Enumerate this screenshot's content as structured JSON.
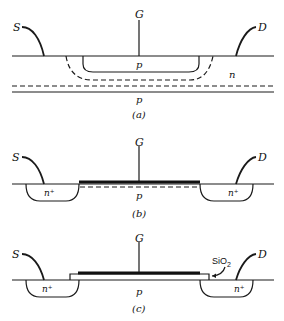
{
  "figure": {
    "panels": [
      {
        "id": "a",
        "caption": "(a)",
        "terminals": {
          "source": "S",
          "gate": "G",
          "drain": "D"
        },
        "regions": {
          "well": "p",
          "body": "n",
          "substrate": "p"
        }
      },
      {
        "id": "b",
        "caption": "(b)",
        "terminals": {
          "source": "S",
          "gate": "G",
          "drain": "D"
        },
        "regions": {
          "source_diffusion": "n⁺",
          "drain_diffusion": "n⁺",
          "substrate": "p"
        }
      },
      {
        "id": "c",
        "caption": "(c)",
        "terminals": {
          "source": "S",
          "gate": "G",
          "drain": "D"
        },
        "regions": {
          "source_diffusion": "n⁺",
          "drain_diffusion": "n⁺",
          "substrate": "p"
        },
        "annotation": {
          "oxide_label": "SiO",
          "oxide_subscript": "2"
        }
      }
    ]
  }
}
